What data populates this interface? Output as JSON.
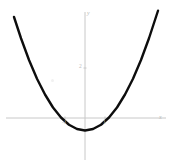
{
  "figure": {
    "background_color": "#ffffff",
    "curve_color": "#0d0d0d",
    "axis_color": "#c8c8c8",
    "label_color": "#bdbdbd"
  },
  "axes": {
    "x_axis_label": "x",
    "y_axis_label": "y",
    "x_ticks": [
      {
        "label": "-1",
        "value": -1
      },
      {
        "label": "1",
        "value": 1
      }
    ],
    "y_ticks": [
      {
        "label": "2",
        "value": 2
      }
    ]
  },
  "chart_data": {
    "type": "line",
    "title": "",
    "subtitle": "",
    "xlabel": "x",
    "ylabel": "y",
    "xlim": [
      -3.55,
      4.35
    ],
    "ylim": [
      -2.0,
      4.2
    ],
    "grid": false,
    "legend": null,
    "annotations": [],
    "series": [
      {
        "name": "parabola",
        "equation": "y = 0.36 x^2 - 0.5",
        "color": "#0d0d0d",
        "line_width": 2.4,
        "x": [
          -3.55,
          -3.2,
          -2.8,
          -2.4,
          -2.0,
          -1.6,
          -1.2,
          -0.8,
          -0.4,
          0.0,
          0.4,
          0.8,
          1.2,
          1.6,
          2.0,
          2.4,
          2.8,
          3.2,
          3.65
        ],
        "values": [
          4.04,
          3.19,
          2.32,
          1.57,
          0.94,
          0.42,
          0.02,
          -0.27,
          -0.44,
          -0.5,
          -0.44,
          -0.27,
          0.02,
          0.42,
          0.94,
          1.57,
          2.32,
          3.19,
          4.29
        ]
      }
    ],
    "vertex": {
      "x": 0,
      "y": -0.5
    },
    "x_intercepts": [
      -1.18,
      1.18
    ]
  }
}
